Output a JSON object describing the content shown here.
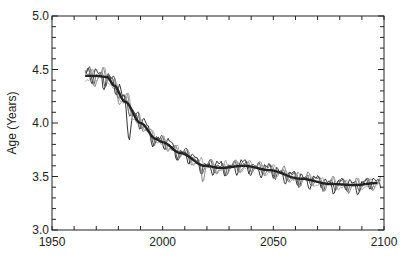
{
  "chart_data": {
    "type": "line",
    "title": "",
    "xlabel": "",
    "ylabel": "Age (Years)",
    "xlim": [
      1950,
      2100
    ],
    "ylim": [
      3.0,
      5.0
    ],
    "x_ticks": [
      1950,
      2000,
      2050,
      2100
    ],
    "x_minor_step": 10,
    "y_ticks": [
      3.0,
      3.5,
      4.0,
      4.5,
      5.0
    ],
    "y_tick_labels": [
      "3.0",
      "3.5",
      "4.0",
      "4.5",
      "5.0"
    ],
    "y_minor_step": 0.1,
    "grid": false,
    "legend": null,
    "series": [
      {
        "name": "smoothed mean",
        "style": "thick dark",
        "color": "#222222",
        "x": [
          1965,
          1970,
          1975,
          1978,
          1983,
          1990,
          1997,
          2000,
          2008,
          2019,
          2026,
          2037,
          2048,
          2062,
          2076,
          2087,
          2097
        ],
        "values": [
          4.44,
          4.44,
          4.43,
          4.35,
          4.2,
          4.0,
          3.85,
          3.82,
          3.72,
          3.6,
          3.58,
          3.6,
          3.56,
          3.48,
          3.43,
          3.42,
          3.44
        ]
      },
      {
        "name": "ensemble member 1",
        "style": "thin",
        "color": "#333333",
        "seed": 1,
        "amplitude": 0.08
      },
      {
        "name": "ensemble member 2",
        "style": "thin",
        "color": "#555555",
        "seed": 2,
        "amplitude": 0.07
      },
      {
        "name": "ensemble member 3",
        "style": "thin",
        "color": "#888888",
        "seed": 3,
        "amplitude": 0.07
      },
      {
        "name": "ensemble member 4",
        "style": "thin",
        "color": "#aaaaaa",
        "seed": 4,
        "amplitude": 0.06
      }
    ],
    "annotations": [
      {
        "text": "dip near 1985",
        "x": 1985,
        "y": 3.78
      }
    ]
  },
  "labels": {
    "ylabel": "Age (Years)",
    "x_tick_labels": [
      "1950",
      "2000",
      "2050",
      "2100"
    ]
  }
}
